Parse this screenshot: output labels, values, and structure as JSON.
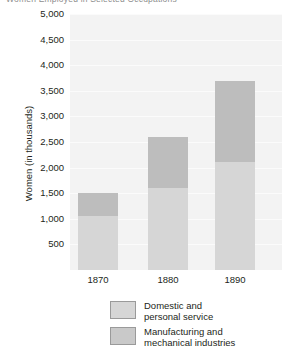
{
  "title_strip": {
    "cropped_title": "Women Employed in Selected Occupations"
  },
  "chart_data": {
    "type": "bar",
    "stacked": true,
    "title": "",
    "xlabel": "",
    "ylabel": "Women (in thousands)",
    "categories": [
      "1870",
      "1880",
      "1890"
    ],
    "ylim": [
      0,
      5000
    ],
    "ytick_labels": [
      "5,000",
      "4,500",
      "4,000",
      "3,500",
      "3,000",
      "2,500",
      "2,000",
      "1,500",
      "1,000",
      "500"
    ],
    "ytick_values": [
      5000,
      4500,
      4000,
      3500,
      3000,
      2500,
      2000,
      1500,
      1000,
      500
    ],
    "grid": true,
    "legend_position": "bottom",
    "series": [
      {
        "name": "Domestic and personal service",
        "label_line1": "Domestic and",
        "label_line2": "personal service",
        "color": "#d6d6d6",
        "values": [
          1050,
          1600,
          2100
        ]
      },
      {
        "name": "Manufacturing and mechanical industries",
        "label_line1": "Manufacturing and",
        "label_line2": "mechanical industries",
        "color": "#bdbdbd",
        "values": [
          450,
          1000,
          1600
        ]
      }
    ],
    "totals": [
      1500,
      2600,
      3700
    ]
  },
  "colors": {
    "plot_background": "#f3f3f3",
    "page_background": "#ffffff",
    "text": "#231f20",
    "domestic": "#d6d6d6",
    "manufacturing": "#bdbdbd",
    "legend_border": "#9a9a9a"
  }
}
